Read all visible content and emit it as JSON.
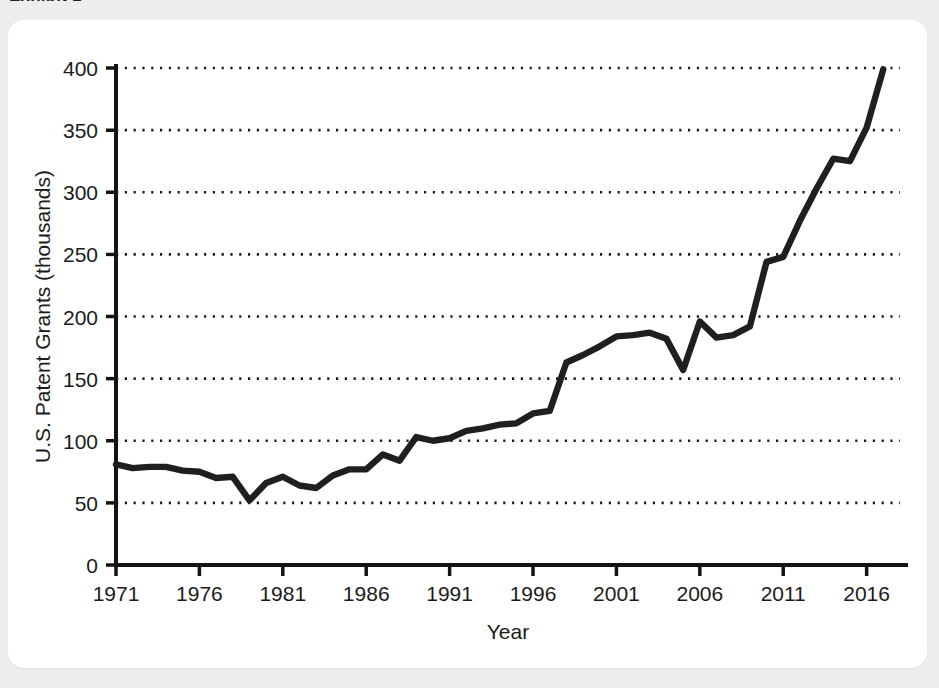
{
  "page": {
    "background_color": "#ededed",
    "card_color": "#ffffff"
  },
  "header": {
    "title": "Exhibit 1"
  },
  "chart_data": {
    "type": "line",
    "title": "",
    "xlabel": "Year",
    "ylabel": "U.S. Patent Grants (thousands)",
    "xlim": [
      1971,
      2018
    ],
    "ylim": [
      0,
      400
    ],
    "xticks": [
      1971,
      1976,
      1981,
      1986,
      1991,
      1996,
      2001,
      2006,
      2011,
      2016
    ],
    "yticks": [
      0,
      50,
      100,
      150,
      200,
      250,
      300,
      350,
      400
    ],
    "xtick_labels": [
      "1971",
      "1976",
      "1981",
      "1986",
      "1991",
      "1996",
      "2001",
      "2006",
      "2011",
      "2016"
    ],
    "ytick_labels": [
      "0",
      "50",
      "100",
      "150",
      "200",
      "250",
      "300",
      "350",
      "400"
    ],
    "grid": "horizontal-dotted",
    "legend": "none",
    "line_color": "#1f1f1f",
    "line_width": 6.4,
    "x": [
      1971,
      1972,
      1973,
      1974,
      1975,
      1976,
      1977,
      1978,
      1979,
      1980,
      1981,
      1982,
      1983,
      1984,
      1985,
      1986,
      1987,
      1988,
      1989,
      1990,
      1991,
      1992,
      1993,
      1994,
      1995,
      1996,
      1997,
      1998,
      1999,
      2000,
      2001,
      2002,
      2003,
      2004,
      2005,
      2006,
      2007,
      2008,
      2009,
      2010,
      2011,
      2012,
      2013,
      2014,
      2015,
      2016,
      2017
    ],
    "values": [
      81,
      78,
      79,
      79,
      76,
      75,
      70,
      71,
      52,
      66,
      71,
      64,
      62,
      72,
      77,
      77,
      89,
      84,
      103,
      100,
      102,
      108,
      110,
      113,
      114,
      122,
      124,
      163,
      169,
      176,
      184,
      185,
      187,
      182,
      157,
      196,
      183,
      185,
      192,
      244,
      248,
      277,
      303,
      327,
      325,
      352,
      399
    ],
    "annotations": []
  }
}
